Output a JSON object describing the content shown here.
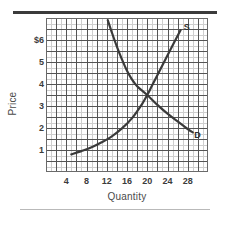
{
  "figure": {
    "rule_top": "decorative-dark-rule",
    "rule_bottom": "decorative-light-rule"
  },
  "chart_data": {
    "type": "line",
    "title": "",
    "subtitle": "",
    "xlabel": "Quantity",
    "ylabel": "Price",
    "grid": true,
    "minor_grid": true,
    "legend_position": "inline-curve-labels",
    "xlim": [
      0,
      32
    ],
    "ylim": [
      0,
      7
    ],
    "xticks": [
      4,
      8,
      12,
      16,
      20,
      24,
      28
    ],
    "xtick_labels": [
      "4",
      "8",
      "12",
      "16",
      "20",
      "24",
      "28"
    ],
    "yticks": [
      1,
      2,
      3,
      4,
      5,
      6
    ],
    "ytick_labels": [
      "1",
      "2",
      "3",
      "4",
      "5",
      "$6"
    ],
    "x_minor_step": 1,
    "y_minor_step": 0.25,
    "x_major_step": 2,
    "y_major_step": 0.5,
    "equilibrium": {
      "quantity": 20,
      "price": 3.5,
      "label": ""
    },
    "series": [
      {
        "name": "S",
        "label": "S",
        "role": "supply",
        "color": "#3a3a3a",
        "label_x": 27.2,
        "label_y": 6.55,
        "points": [
          {
            "x": 5.0,
            "y": 0.8
          },
          {
            "x": 7.0,
            "y": 0.95
          },
          {
            "x": 9.0,
            "y": 1.12
          },
          {
            "x": 11.0,
            "y": 1.35
          },
          {
            "x": 13.0,
            "y": 1.62
          },
          {
            "x": 15.0,
            "y": 1.98
          },
          {
            "x": 17.0,
            "y": 2.45
          },
          {
            "x": 19.0,
            "y": 3.1
          },
          {
            "x": 20.0,
            "y": 3.5
          },
          {
            "x": 21.0,
            "y": 3.95
          },
          {
            "x": 23.0,
            "y": 4.85
          },
          {
            "x": 25.0,
            "y": 5.75
          },
          {
            "x": 26.6,
            "y": 6.45
          }
        ]
      },
      {
        "name": "D",
        "label": "D",
        "role": "demand",
        "color": "#3a3a3a",
        "label_x": 29.3,
        "label_y": 1.62,
        "points": [
          {
            "x": 12.2,
            "y": 6.9
          },
          {
            "x": 13.0,
            "y": 6.35
          },
          {
            "x": 14.0,
            "y": 5.7
          },
          {
            "x": 15.0,
            "y": 5.12
          },
          {
            "x": 16.0,
            "y": 4.6
          },
          {
            "x": 17.0,
            "y": 4.2
          },
          {
            "x": 18.0,
            "y": 3.9
          },
          {
            "x": 20.0,
            "y": 3.5
          },
          {
            "x": 22.0,
            "y": 3.05
          },
          {
            "x": 24.0,
            "y": 2.65
          },
          {
            "x": 26.0,
            "y": 2.3
          },
          {
            "x": 28.0,
            "y": 1.95
          },
          {
            "x": 29.0,
            "y": 1.8
          }
        ]
      }
    ]
  }
}
